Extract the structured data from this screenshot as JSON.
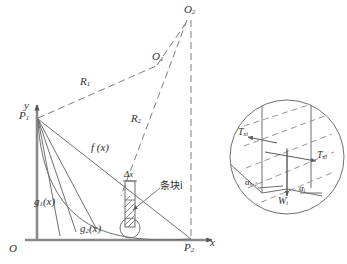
{
  "figure": {
    "type": "engineering-diagram",
    "colors": {
      "stroke": "#6f6f6f",
      "dark_stroke": "#4a4a4a",
      "text": "#2f2f2f",
      "background": "#ffffff"
    }
  },
  "main_plot": {
    "axes": {
      "y_label": "y",
      "x_label": "x",
      "origin_label": "O"
    },
    "points": [
      {
        "id": "P1",
        "label": "P",
        "sub": "1",
        "x": 37,
        "y": 117
      },
      {
        "id": "P2",
        "label": "P",
        "sub": "2",
        "x": 192,
        "y": 240
      },
      {
        "id": "O1",
        "label": "O",
        "sub": "1",
        "x": 158,
        "y": 62
      },
      {
        "id": "O2",
        "label": "O",
        "sub": "2",
        "x": 190,
        "y": 12
      }
    ],
    "labels": {
      "radius_1": {
        "label": "R",
        "sub": "1"
      },
      "radius_2": {
        "label": "R",
        "sub": "2"
      },
      "function_f": "f (x)",
      "function_g1": {
        "label": "g",
        "sub": "1",
        "arg": "(x)"
      },
      "function_g2": {
        "label": "g",
        "sub": "2",
        "arg": "(x)"
      },
      "delta_x": "Δx",
      "slice_annotation": "条块i"
    }
  },
  "detail_inset": {
    "title": "slice-force-detail",
    "labels": {
      "thrust_left": {
        "label": "T",
        "sub": "xi"
      },
      "thrust_right": {
        "label": "T",
        "sub": "xi"
      },
      "weight": {
        "label": "W",
        "sub": "i"
      },
      "angle_left": {
        "label": "α",
        "sub": "n-1"
      },
      "angle_right": {
        "label": "α",
        "sub": "i"
      }
    }
  }
}
